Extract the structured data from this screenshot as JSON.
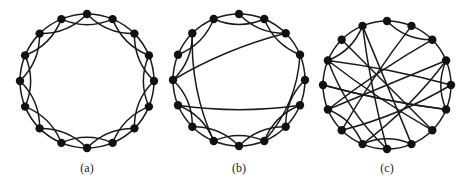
{
  "diagram": {
    "node_count": 16,
    "node_radius": 4.2,
    "stroke_color": "#1a1a1a",
    "node_color": "#111111",
    "edge_width": 1.5,
    "panels": [
      {
        "id": "a",
        "label": "(a)",
        "center": [
          87,
          81
        ],
        "radius": 67,
        "label_pos": [
          87,
          161
        ],
        "ring_neighbors": 2,
        "removed_ring_edges": [],
        "rewired_edges": []
      },
      {
        "id": "b",
        "label": "(b)",
        "center": [
          239,
          80
        ],
        "radius": 66,
        "label_pos": [
          239,
          161
        ],
        "ring_neighbors": 2,
        "removed_ring_edges": [
          [
            14,
            0
          ],
          [
            2,
            4
          ],
          [
            11,
            13
          ],
          [
            3,
            5
          ]
        ],
        "rewired_edges": [
          [
            14,
            9
          ],
          [
            2,
            12
          ],
          [
            11,
            5
          ],
          [
            3,
            7
          ]
        ]
      },
      {
        "id": "c",
        "label": "(c)",
        "center": [
          387,
          85
        ],
        "radius": 64,
        "label_pos": [
          387,
          161
        ],
        "ring_neighbors": 2,
        "removed_ring_edges": [
          [
            15,
            1
          ],
          [
            14,
            0
          ],
          [
            1,
            3
          ],
          [
            2,
            4
          ],
          [
            4,
            6
          ],
          [
            5,
            7
          ],
          [
            10,
            12
          ],
          [
            11,
            13
          ],
          [
            12,
            14
          ],
          [
            6,
            8
          ],
          [
            8,
            10
          ]
        ],
        "rewired_edges": [
          [
            15,
            8
          ],
          [
            14,
            6
          ],
          [
            1,
            10
          ],
          [
            2,
            11
          ],
          [
            4,
            13
          ],
          [
            5,
            12
          ],
          [
            10,
            4
          ],
          [
            11,
            3
          ],
          [
            12,
            5
          ],
          [
            13,
            8
          ],
          [
            7,
            15
          ],
          [
            3,
            9
          ],
          [
            6,
            13
          ]
        ]
      }
    ]
  }
}
